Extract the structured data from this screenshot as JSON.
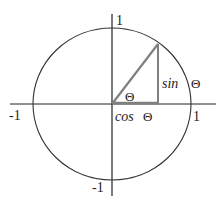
{
  "diagram": {
    "type": "unit-circle",
    "colors": {
      "background": "#ffffff",
      "axis": "#222222",
      "circle": "#333333",
      "triangle": "#808080",
      "text": "#222222"
    },
    "geometry": {
      "center": [
        112,
        104
      ],
      "rx": 79,
      "ry": 76,
      "point_on_circle": [
        158,
        44
      ],
      "foot": [
        158,
        104
      ]
    },
    "labels": {
      "y_top": "1",
      "y_bottom": "-1",
      "x_left": "-1",
      "x_right": "1",
      "angle": "Θ",
      "sin_fn": "sin",
      "sin_arg": "Θ",
      "cos_fn": "cos",
      "cos_arg": "Θ"
    }
  }
}
